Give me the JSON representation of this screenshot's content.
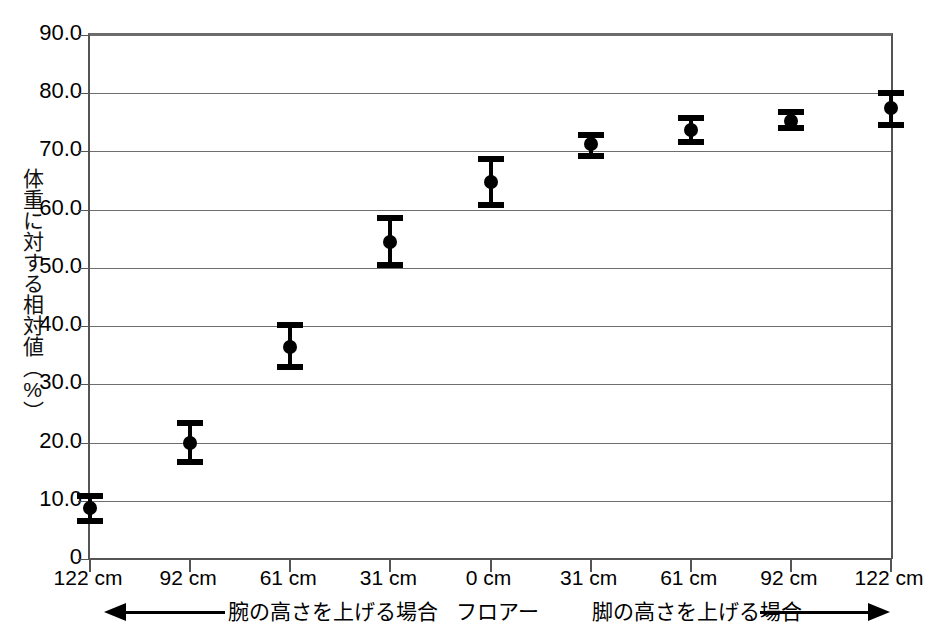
{
  "chart_data": {
    "type": "scatter",
    "title": "",
    "xlabel": "",
    "ylabel": "体重に対する相対値（%）",
    "ylim": [
      0,
      90
    ],
    "ytick_labels": [
      "90.0",
      "80.0",
      "70.0",
      "60.0",
      "50.0",
      "40.0",
      "30.0",
      "20.0",
      "10.0",
      "0"
    ],
    "ytick_values": [
      90,
      80,
      70,
      60,
      50,
      40,
      30,
      20,
      10,
      0
    ],
    "grid": true,
    "legend": "none",
    "categories": [
      "122 cm",
      "92 cm",
      "61 cm",
      "31 cm",
      "0 cm",
      "31 cm",
      "61 cm",
      "92 cm",
      "122 cm"
    ],
    "values": [
      8.7,
      20.0,
      36.4,
      54.5,
      64.8,
      71.3,
      73.6,
      75.3,
      77.5
    ],
    "error_low": [
      6.6,
      16.7,
      33.0,
      50.5,
      60.8,
      69.2,
      71.6,
      74.0,
      74.6
    ],
    "error_high": [
      10.8,
      23.3,
      40.2,
      58.6,
      68.7,
      72.9,
      75.7,
      76.7,
      80.0
    ],
    "annotations": [
      {
        "id": "left-arrow-label",
        "text": "腕の高さを上げる場合",
        "arrow": "left"
      },
      {
        "id": "center-label",
        "text": "フロアー",
        "arrow": "none"
      },
      {
        "id": "right-arrow-label",
        "text": "脚の高さを上げる場合",
        "arrow": "right"
      }
    ],
    "marker_style": "filled-circle-with-error-bars",
    "marker_color": "#000000",
    "axis_color": "#555555",
    "gridline_color": "#6e6e6e",
    "background_color": "#ffffff"
  },
  "axis": {
    "y_title": "体重に対する相対値（%）"
  },
  "annotation": {
    "left_label": "腕の高さを上げる場合",
    "center_label": "フロアー",
    "right_label": "脚の高さを上げる場合"
  }
}
